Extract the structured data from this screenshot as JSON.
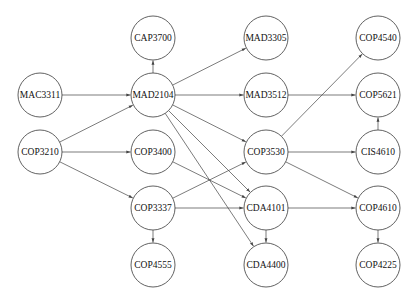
{
  "diagram": {
    "type": "directed-graph",
    "node_radius": 22,
    "nodes": [
      {
        "id": "CAP3700",
        "label": "CAP3700",
        "x": 153,
        "y": 38
      },
      {
        "id": "MAC3311",
        "label": "MAC3311",
        "x": 40,
        "y": 95
      },
      {
        "id": "MAD2104",
        "label": "MAD2104",
        "x": 153,
        "y": 95
      },
      {
        "id": "MAD3305",
        "label": "MAD3305",
        "x": 266,
        "y": 38
      },
      {
        "id": "MAD3512",
        "label": "MAD3512",
        "x": 266,
        "y": 95
      },
      {
        "id": "COP4540",
        "label": "COP4540",
        "x": 378,
        "y": 38
      },
      {
        "id": "COP5621",
        "label": "COP5621",
        "x": 378,
        "y": 95
      },
      {
        "id": "COP3210",
        "label": "COP3210",
        "x": 40,
        "y": 152
      },
      {
        "id": "COP3400",
        "label": "COP3400",
        "x": 153,
        "y": 152
      },
      {
        "id": "COP3530",
        "label": "COP3530",
        "x": 266,
        "y": 152
      },
      {
        "id": "CIS4610",
        "label": "CIS4610",
        "x": 378,
        "y": 152
      },
      {
        "id": "COP3337",
        "label": "COP3337",
        "x": 153,
        "y": 208
      },
      {
        "id": "CDA4101",
        "label": "CDA4101",
        "x": 266,
        "y": 208
      },
      {
        "id": "COP4610",
        "label": "COP4610",
        "x": 378,
        "y": 208
      },
      {
        "id": "COP4555",
        "label": "COP4555",
        "x": 153,
        "y": 265
      },
      {
        "id": "CDA4400",
        "label": "CDA4400",
        "x": 266,
        "y": 265
      },
      {
        "id": "COP4225",
        "label": "COP4225",
        "x": 378,
        "y": 265
      }
    ],
    "edges": [
      {
        "from": "MAC3311",
        "to": "MAD2104"
      },
      {
        "from": "COP3210",
        "to": "MAD2104"
      },
      {
        "from": "COP3210",
        "to": "COP3400"
      },
      {
        "from": "COP3210",
        "to": "COP3337"
      },
      {
        "from": "MAD2104",
        "to": "CAP3700"
      },
      {
        "from": "MAD2104",
        "to": "MAD3305"
      },
      {
        "from": "MAD2104",
        "to": "MAD3512"
      },
      {
        "from": "MAD2104",
        "to": "COP3530"
      },
      {
        "from": "MAD2104",
        "to": "CDA4101"
      },
      {
        "from": "MAD2104",
        "to": "CDA4400"
      },
      {
        "from": "MAD3512",
        "to": "COP5621"
      },
      {
        "from": "COP3530",
        "to": "COP4540"
      },
      {
        "from": "COP3530",
        "to": "CIS4610"
      },
      {
        "from": "COP3530",
        "to": "COP4610"
      },
      {
        "from": "CIS4610",
        "to": "COP5621"
      },
      {
        "from": "COP3400",
        "to": "CDA4101"
      },
      {
        "from": "COP3337",
        "to": "COP3530"
      },
      {
        "from": "COP3337",
        "to": "CDA4101"
      },
      {
        "from": "COP3337",
        "to": "COP4555"
      },
      {
        "from": "CDA4101",
        "to": "CDA4400"
      },
      {
        "from": "CDA4101",
        "to": "COP4610"
      },
      {
        "from": "COP4610",
        "to": "COP4225"
      }
    ]
  }
}
